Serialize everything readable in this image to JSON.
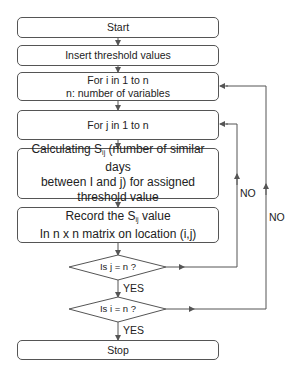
{
  "flowchart": {
    "nodes": [
      {
        "id": "start",
        "type": "terminal",
        "lines": [
          "Start"
        ]
      },
      {
        "id": "insert",
        "type": "process",
        "lines": [
          "Insert threshold values"
        ]
      },
      {
        "id": "loop_i",
        "type": "process",
        "lines": [
          "For i in 1 to n",
          "n: number of variables"
        ]
      },
      {
        "id": "loop_j",
        "type": "process",
        "lines": [
          "For j in 1 to n"
        ]
      },
      {
        "id": "calc",
        "type": "process",
        "prefix": "Calculating S",
        "sub": "ij",
        "suffix": " (number of similar days",
        "lines": [
          "between I and j) for assigned",
          "threshold value"
        ]
      },
      {
        "id": "record",
        "type": "process",
        "prefix": "Record the S",
        "sub": "ij",
        "suffix": " value",
        "lines": [
          "In n x n matrix on location (i,j)"
        ]
      },
      {
        "id": "dec_j",
        "type": "decision",
        "lines": [
          "Is j = n ?"
        ]
      },
      {
        "id": "dec_i",
        "type": "decision",
        "lines": [
          "Is i = n ?"
        ]
      },
      {
        "id": "stop",
        "type": "terminal",
        "lines": [
          "Stop"
        ]
      }
    ],
    "edge_labels": {
      "dec_j_yes": "YES",
      "dec_i_yes": "YES",
      "dec_j_no": "NO",
      "dec_i_no": "NO"
    },
    "colors": {
      "stroke": "#555555",
      "background": "#ffffff",
      "text": "#222222"
    }
  }
}
